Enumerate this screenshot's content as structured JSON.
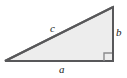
{
  "figure": {
    "type": "geometry-diagram",
    "shape_name": "right-triangle",
    "background_color": "#ffffff",
    "fill_color": "#ededed",
    "stroke_color": "#58585a",
    "stroke_width": 2,
    "label_color": "#1b1b1b",
    "width": 127,
    "height": 78,
    "vertices": {
      "bottom_left": [
        5,
        61
      ],
      "bottom_right": [
        113,
        61
      ],
      "top_right": [
        113,
        7
      ]
    },
    "polygon_points": "5,61 113,61 113,7",
    "sides": {
      "hypotenuse": {
        "label": "c",
        "from": [
          5,
          61
        ],
        "to": [
          113,
          7
        ]
      },
      "horizontal_leg": {
        "label": "a",
        "from": [
          5,
          61
        ],
        "to": [
          113,
          61
        ]
      },
      "vertical_leg": {
        "label": "b",
        "from": [
          113,
          61
        ],
        "to": [
          113,
          7
        ]
      }
    },
    "right_angle_marker": {
      "name": "right-angle-marker",
      "corner": "bottom-right",
      "size": 8,
      "points": "104,61 104,53 112,53 112,61"
    }
  }
}
